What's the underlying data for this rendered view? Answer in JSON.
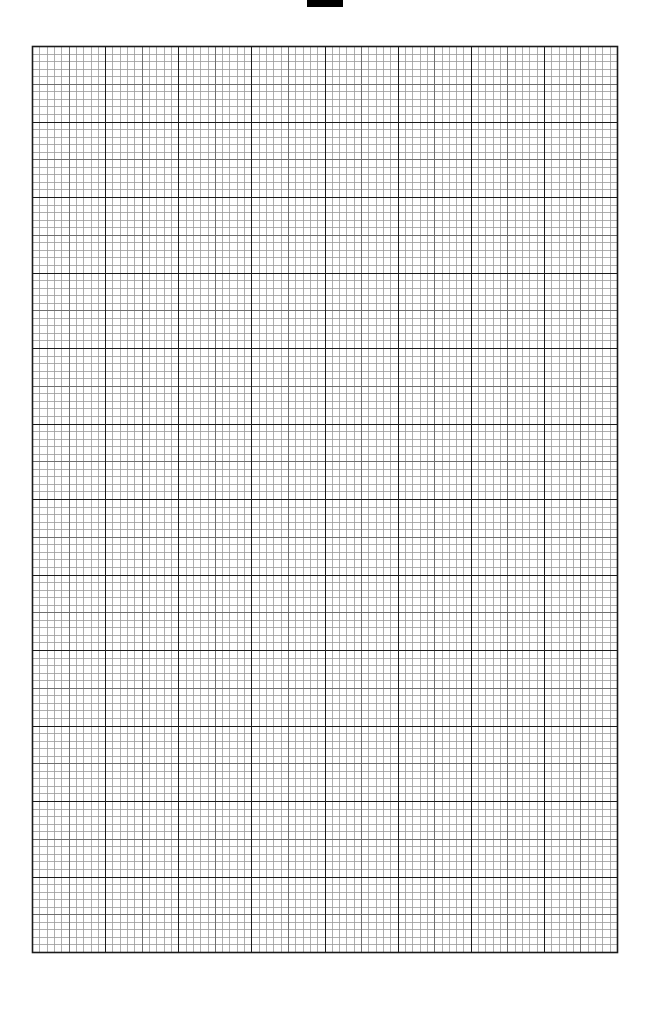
{
  "page": {
    "type": "graph-paper",
    "background": "#ffffff"
  },
  "top_marker": {
    "x": 307,
    "y": 0,
    "width": 36,
    "height": 7,
    "color": "#000000"
  },
  "grid": {
    "left": 32,
    "top": 46,
    "width": 585,
    "height": 906,
    "major_columns": 8,
    "major_rows": 12,
    "minor_per_major": 10,
    "major_color": "#1a1a1a",
    "minor_color": "#9a9a9a",
    "mid_color": "#6e6e6e",
    "border_color": "#1a1a1a"
  }
}
